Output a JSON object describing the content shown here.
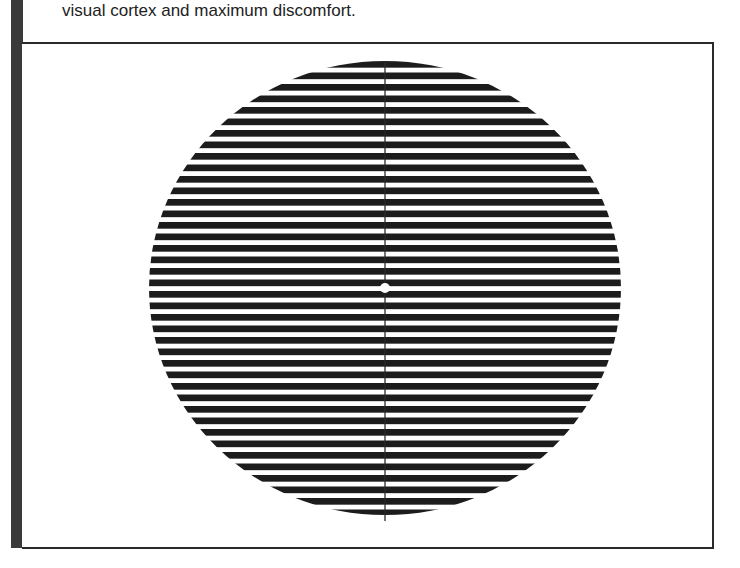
{
  "caption": {
    "text": "visual cortex and maximum discomfort."
  },
  "figure": {
    "stripe_color": "#1c1c1c",
    "background_color": "#ffffff",
    "circle": {
      "center_x": 385,
      "center_y": 288,
      "radius_x": 236,
      "radius_y": 227
    },
    "stripe_period_px": 11.5,
    "stripe_count": 40,
    "vertical_line": {
      "x": 385,
      "y_top": 61,
      "y_bottom": 521
    },
    "fixation_point": {
      "x": 385,
      "y": 288,
      "radius": 5
    }
  },
  "colors": {
    "side_bar": "#3a3a3a",
    "border": "#2a2a2a",
    "text": "#222222"
  }
}
